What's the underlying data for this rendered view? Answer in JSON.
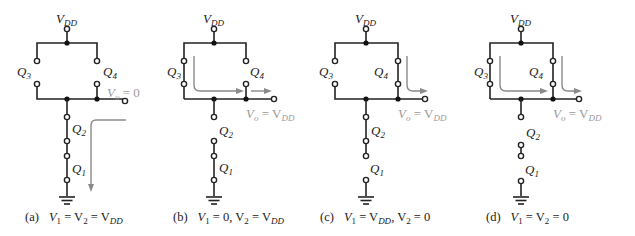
{
  "figure": {
    "supply_label": "V",
    "supply_sub": "DD",
    "transistor_labels": {
      "q1": "Q",
      "q1_sub": "1",
      "q2": "Q",
      "q2_sub": "2",
      "q3": "Q",
      "q3_sub": "3",
      "q4": "Q",
      "q4_sub": "4"
    },
    "colors": {
      "wire": "#222222",
      "current_flow": "#8a8a8a",
      "output_label": "#9a9a9a"
    },
    "panels": [
      {
        "id": "a",
        "tag": "(a)",
        "condition": "V1 = V2 = VDD",
        "cond_parts": [
          "V",
          "1",
          " = V",
          "2",
          " = V",
          "DD"
        ],
        "output": "Vo = 0",
        "output_parts": [
          "V",
          "o",
          " = 0"
        ],
        "switches": {
          "q1": "closed",
          "q2": "closed",
          "q3": "open",
          "q4": "open"
        }
      },
      {
        "id": "b",
        "tag": "(b)",
        "condition": "V1 = 0, V2 = VDD",
        "cond_parts": [
          "V",
          "1",
          " = 0, V",
          "2",
          " = V",
          "DD"
        ],
        "output": "Vo = VDD",
        "output_parts": [
          "V",
          "o",
          " = V",
          "DD"
        ],
        "switches": {
          "q1": "closed",
          "q2": "open",
          "q3": "closed",
          "q4": "open"
        }
      },
      {
        "id": "c",
        "tag": "(c)",
        "condition": "V1 = VDD, V2 = 0",
        "cond_parts": [
          "V",
          "1",
          " = V",
          "DD",
          ", V",
          "2",
          " = 0"
        ],
        "output": "Vo = VDD",
        "output_parts": [
          "V",
          "o",
          " = V",
          "DD"
        ],
        "switches": {
          "q1": "open",
          "q2": "closed",
          "q3": "open",
          "q4": "closed"
        }
      },
      {
        "id": "d",
        "tag": "(d)",
        "condition": "V1 = V2 = 0",
        "cond_parts": [
          "V",
          "1",
          " = V",
          "2",
          " = 0"
        ],
        "output": "Vo = VDD",
        "output_parts": [
          "V",
          "o",
          " = V",
          "DD"
        ],
        "switches": {
          "q1": "open",
          "q2": "open",
          "q3": "closed",
          "q4": "closed"
        }
      }
    ]
  }
}
